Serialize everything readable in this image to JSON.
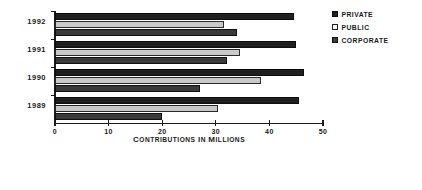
{
  "chart_data": {
    "type": "bar",
    "orientation": "horizontal",
    "title": "",
    "xlabel": "Contributions in Millions",
    "ylabel": "",
    "categories": [
      "1992",
      "1991",
      "1990",
      "1989"
    ],
    "series": [
      {
        "name": "Private",
        "values": [
          44.5,
          45.0,
          46.5,
          45.5
        ],
        "color": "#1f1f1f"
      },
      {
        "name": "Public",
        "values": [
          31.5,
          34.5,
          38.5,
          30.5
        ],
        "color": "#c9c9c9"
      },
      {
        "name": "Corporate",
        "values": [
          34.0,
          32.0,
          27.0,
          20.0
        ],
        "color": "#3a3a3a"
      }
    ],
    "xlim": [
      0,
      50
    ],
    "xticks": [
      0,
      10,
      20,
      30,
      40,
      50
    ],
    "xtick_labels": [
      "0",
      "10",
      "20",
      "30",
      "40",
      "50"
    ],
    "grid": false,
    "legend_position": "right"
  },
  "legend": {
    "items": [
      {
        "label": "Private",
        "swatch": "legend-swatch-private"
      },
      {
        "label": "Public",
        "swatch": "legend-swatch-public"
      },
      {
        "label": "Corporate",
        "swatch": "legend-swatch-corporate"
      }
    ]
  },
  "axis": {
    "x_title": "Contributions in Millions"
  }
}
